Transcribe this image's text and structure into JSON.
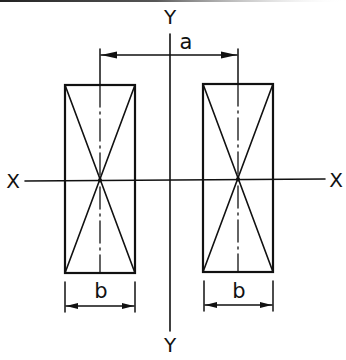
{
  "figure": {
    "colors": {
      "ink": "#111111",
      "background": "#ffffff"
    }
  },
  "axes": {
    "x_left_label": "X",
    "x_right_label": "X",
    "y_top_label": "Y",
    "y_bottom_label": "Y"
  },
  "dimensions": {
    "center_spacing_label": "a",
    "left_width_label": "b",
    "right_width_label": "b"
  },
  "sections": [
    {
      "name": "left",
      "x": 65,
      "y": 85,
      "width": 70,
      "height": 188
    },
    {
      "name": "right",
      "x": 203,
      "y": 84,
      "width": 70,
      "height": 188
    }
  ]
}
